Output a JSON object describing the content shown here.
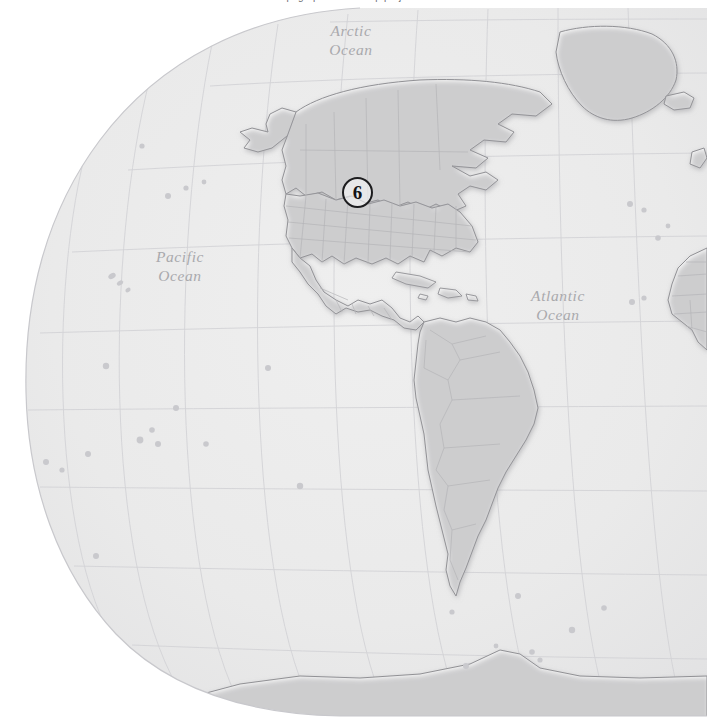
{
  "page": {
    "background_color": "#ffffff",
    "caption_clipped_text": "topographic  relief  map  projection"
  },
  "map": {
    "projection": "winkel-tripel",
    "ocean_color": "#eaeaea",
    "land_color": "#fafafa",
    "coastline_color": "#8f8f93",
    "border_color": "#b4b4b8",
    "graticule_color": "#d2d2d6",
    "globe_edge_color": "#c8c8cc",
    "ocean_labels": [
      {
        "name": "arctic-ocean-label",
        "line1": "Arctic",
        "line2": "Ocean",
        "x": 351,
        "y": 36
      },
      {
        "name": "pacific-ocean-label",
        "line1": "Pacific",
        "line2": "Ocean",
        "x": 180,
        "y": 262
      },
      {
        "name": "atlantic-ocean-label",
        "line1": "Atlantic",
        "line2": "Ocean",
        "x": 558,
        "y": 301
      }
    ],
    "graticule": {
      "parallels_deg": [
        75,
        60,
        45,
        30,
        15,
        0,
        -15,
        -30,
        -45,
        -60
      ],
      "meridians_deg": [
        -170,
        -150,
        -130,
        -110,
        -90,
        -70,
        -50,
        -30,
        -10
      ]
    },
    "landmasses": [
      "north-america",
      "greenland",
      "iceland",
      "british-isles",
      "west-africa",
      "central-america",
      "caribbean-islands",
      "south-america",
      "antarctica",
      "pacific-islands"
    ]
  },
  "markers": [
    {
      "name": "location-marker-6",
      "label": "6",
      "x": 342,
      "y": 177,
      "size": 31,
      "ring_color": "#1d1d1f",
      "text_color": "#141416",
      "region": "central-united-states"
    }
  ]
}
